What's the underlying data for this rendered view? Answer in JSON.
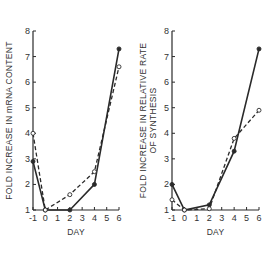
{
  "chart_data": [
    {
      "type": "line",
      "title": "",
      "xlabel": "DAY",
      "ylabel": "FOLD INCREASE IN mRNA CONTENT",
      "x": [
        -1,
        0,
        2,
        4,
        6
      ],
      "xticks": [
        "-1",
        "0",
        "1",
        "2",
        "3",
        "4",
        "5",
        "6"
      ],
      "yticks": [
        "1",
        "2",
        "3",
        "4",
        "5",
        "6",
        "7",
        "8"
      ],
      "xlim": [
        -1,
        6
      ],
      "ylim": [
        1,
        8
      ],
      "grid": false,
      "legend": null,
      "series": [
        {
          "name": "filled circles (solid line)",
          "marker": "filled-circle",
          "line": "solid",
          "values": [
            2.9,
            1.0,
            1.0,
            2.0,
            7.3
          ]
        },
        {
          "name": "open circles (dashed line)",
          "marker": "open-circle",
          "line": "dashed",
          "values": [
            4.0,
            1.0,
            1.6,
            2.5,
            6.6
          ]
        }
      ]
    },
    {
      "type": "line",
      "title": "",
      "xlabel": "DAY",
      "ylabel": "FOLD INCREASE IN RELATIVE RATE OF SYNTHESIS",
      "ylabel_lines": [
        "FOLD INCREASE IN RELATIVE RATE",
        "OF SYNTHESIS"
      ],
      "x": [
        -1,
        0,
        2,
        4,
        6
      ],
      "xticks": [
        "-1",
        "0",
        "1",
        "2",
        "3",
        "4",
        "5",
        "6"
      ],
      "yticks": [
        "1",
        "2",
        "3",
        "4",
        "5",
        "6",
        "7",
        "8"
      ],
      "xlim": [
        -1,
        6
      ],
      "ylim": [
        1,
        8
      ],
      "grid": false,
      "legend": null,
      "series": [
        {
          "name": "filled circles (solid line)",
          "marker": "filled-circle",
          "line": "solid",
          "values": [
            2.0,
            1.0,
            1.2,
            3.3,
            7.3
          ]
        },
        {
          "name": "open circles (dashed line)",
          "marker": "open-circle",
          "line": "dashed",
          "values": [
            1.4,
            1.0,
            1.05,
            3.8,
            4.9
          ]
        }
      ]
    }
  ],
  "colors": {
    "ink": "#2a2a2a",
    "background": "#ffffff"
  }
}
